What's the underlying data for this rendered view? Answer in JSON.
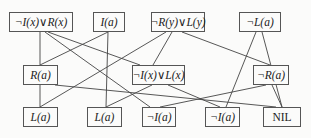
{
  "diagram": {
    "nodes": [
      {
        "id": "n1",
        "label": "¬I(x)∨R(x)",
        "x": 9,
        "y": 12,
        "w": 64,
        "h": 20
      },
      {
        "id": "n2",
        "label": "I(a)",
        "x": 93,
        "y": 12,
        "w": 32,
        "h": 20
      },
      {
        "id": "n3",
        "label": "¬R(y)∨L(y)",
        "x": 151,
        "y": 12,
        "w": 54,
        "h": 20
      },
      {
        "id": "n4",
        "label": "¬L(a)",
        "x": 239,
        "y": 12,
        "w": 42,
        "h": 20
      },
      {
        "id": "n5",
        "label": "R(a)",
        "x": 23,
        "y": 65,
        "w": 35,
        "h": 20
      },
      {
        "id": "n6",
        "label": "¬I(x)∨L(x)",
        "x": 132,
        "y": 65,
        "w": 53,
        "h": 20
      },
      {
        "id": "n7",
        "label": "¬R(a)",
        "x": 253,
        "y": 65,
        "w": 36,
        "h": 20
      },
      {
        "id": "n8",
        "label": "L(a)",
        "x": 23,
        "y": 107,
        "w": 35,
        "h": 20
      },
      {
        "id": "n9",
        "label": "L(a)",
        "x": 87,
        "y": 107,
        "w": 35,
        "h": 20
      },
      {
        "id": "n10",
        "label": "¬I(a)",
        "x": 142,
        "y": 107,
        "w": 34,
        "h": 20
      },
      {
        "id": "n11",
        "label": "¬I(a)",
        "x": 205,
        "y": 107,
        "w": 35,
        "h": 20
      },
      {
        "id": "n12",
        "label": "NIL",
        "x": 263,
        "y": 107,
        "w": 38,
        "h": 20
      }
    ],
    "edges": [
      {
        "x1": 40,
        "y1": 32,
        "x2": 40,
        "y2": 65
      },
      {
        "x1": 45,
        "y1": 32,
        "x2": 150,
        "y2": 107
      },
      {
        "x1": 48,
        "y1": 32,
        "x2": 140,
        "y2": 65
      },
      {
        "x1": 108,
        "y1": 32,
        "x2": 40,
        "y2": 65
      },
      {
        "x1": 108,
        "y1": 32,
        "x2": 106,
        "y2": 107
      },
      {
        "x1": 166,
        "y1": 32,
        "x2": 40,
        "y2": 107
      },
      {
        "x1": 172,
        "y1": 32,
        "x2": 153,
        "y2": 65
      },
      {
        "x1": 182,
        "y1": 32,
        "x2": 270,
        "y2": 65
      },
      {
        "x1": 256,
        "y1": 32,
        "x2": 226,
        "y2": 107
      },
      {
        "x1": 262,
        "y1": 32,
        "x2": 282,
        "y2": 107
      },
      {
        "x1": 40,
        "y1": 85,
        "x2": 40,
        "y2": 107
      },
      {
        "x1": 55,
        "y1": 85,
        "x2": 276,
        "y2": 107
      },
      {
        "x1": 152,
        "y1": 85,
        "x2": 106,
        "y2": 107
      },
      {
        "x1": 168,
        "y1": 85,
        "x2": 220,
        "y2": 107
      },
      {
        "x1": 266,
        "y1": 85,
        "x2": 160,
        "y2": 107
      },
      {
        "x1": 272,
        "y1": 85,
        "x2": 282,
        "y2": 107
      }
    ]
  }
}
